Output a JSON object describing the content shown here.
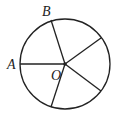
{
  "diagram": {
    "type": "circle-with-radii",
    "stroke_color": "#222222",
    "background": "#ffffff",
    "circle": {
      "cx": 65,
      "cy": 64,
      "r": 45
    },
    "center": {
      "label": "O",
      "x": 65,
      "y": 64
    },
    "radii": [
      {
        "name": "OA",
        "x2": 20,
        "y2": 64
      },
      {
        "name": "OB",
        "x2": 51,
        "y2": 20
      },
      {
        "name": "radius-upper-right",
        "x2": 101,
        "y2": 38
      },
      {
        "name": "radius-lower-right",
        "x2": 101,
        "y2": 91
      },
      {
        "name": "radius-bottom",
        "x2": 51,
        "y2": 107
      }
    ],
    "labels": {
      "A": "A",
      "B": "B",
      "O": "O"
    }
  }
}
